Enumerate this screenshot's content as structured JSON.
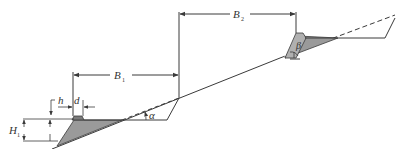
{
  "diagram": {
    "type": "slope terrace retaining wall cross-section",
    "colors": {
      "line": "#3a3a3a",
      "fill": "#9a9a9a",
      "background": "#ffffff"
    },
    "labels": {
      "B1": {
        "main": "B",
        "sub": "1"
      },
      "B2": {
        "main": "B",
        "sub": "2"
      },
      "H": {
        "main": "H",
        "sub": "1"
      },
      "h": "h",
      "d": "d",
      "alpha": "α",
      "beta": "β"
    }
  }
}
